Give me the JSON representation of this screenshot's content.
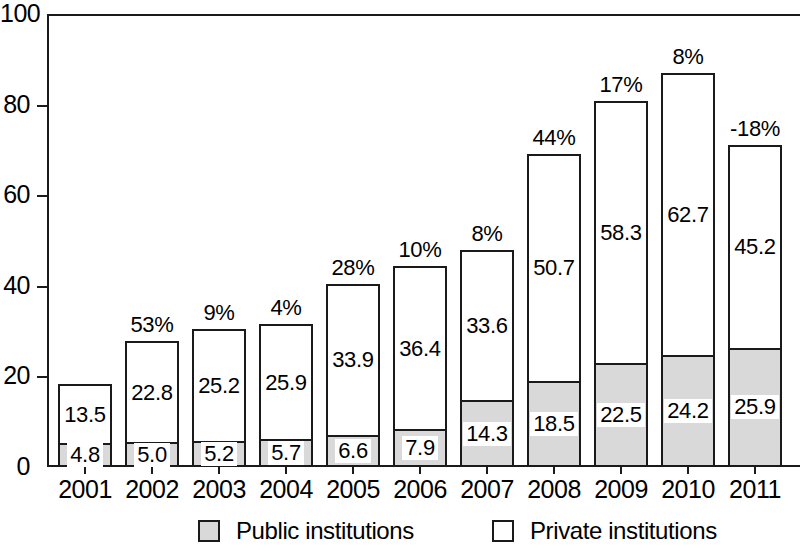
{
  "chart_data": {
    "type": "bar",
    "subtype": "stacked-bar",
    "title": "",
    "subtitle": "",
    "xlabel": "",
    "ylabel": "",
    "ylim": [
      0,
      100
    ],
    "yticks": [
      0,
      20,
      40,
      60,
      80,
      100
    ],
    "grid": false,
    "legend_position": "bottom",
    "categories": [
      "2001",
      "2002",
      "2003",
      "2004",
      "2005",
      "2006",
      "2007",
      "2008",
      "2009",
      "2010",
      "2011"
    ],
    "series": [
      {
        "name": "Public institutions",
        "color": "#d9d9d9",
        "values": [
          4.8,
          5.0,
          5.2,
          5.7,
          6.6,
          7.9,
          14.3,
          18.5,
          22.5,
          24.2,
          25.9
        ],
        "labels": [
          "4.8",
          "5.0",
          "5.2",
          "5.7",
          "6.6",
          "7.9",
          "14.3",
          "18.5",
          "22.5",
          "24.2",
          "25.9"
        ]
      },
      {
        "name": "Private institutions",
        "color": "#ffffff",
        "values": [
          13.5,
          22.8,
          25.2,
          25.9,
          33.9,
          36.4,
          33.6,
          50.7,
          58.3,
          62.7,
          45.2
        ],
        "labels": [
          "13.5",
          "22.8",
          "25.2",
          "25.9",
          "33.9",
          "36.4",
          "33.6",
          "50.7",
          "58.3",
          "62.7",
          "45.2"
        ]
      }
    ],
    "annotations": {
      "name": "growth-percentage",
      "values": [
        "",
        "53%",
        "9%",
        "4%",
        "28%",
        "10%",
        "8%",
        "44%",
        "17%",
        "8%",
        "-18%"
      ]
    },
    "totals": [
      18.3,
      27.8,
      30.4,
      31.6,
      40.5,
      44.3,
      47.9,
      69.2,
      80.8,
      86.9,
      71.1
    ]
  },
  "legend": {
    "items": [
      {
        "label": "Public institutions",
        "swatch": "public"
      },
      {
        "label": "Private institutions",
        "swatch": "private"
      }
    ]
  }
}
